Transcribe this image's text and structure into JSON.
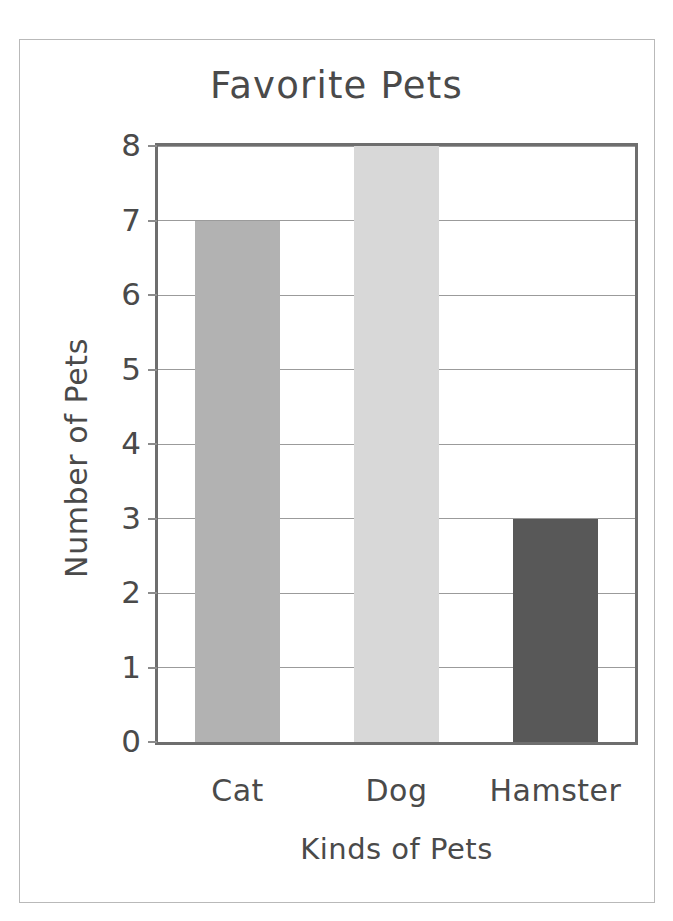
{
  "chart_data": {
    "type": "bar",
    "title": "Favorite Pets",
    "xlabel": "Kinds of Pets",
    "ylabel": "Number of Pets",
    "categories": [
      "Cat",
      "Dog",
      "Hamster"
    ],
    "values": [
      7,
      8,
      3
    ],
    "series": [
      {
        "name": "Number of Pets",
        "values": [
          7,
          8,
          3
        ]
      }
    ],
    "ylim": [
      0,
      8
    ],
    "ytick_labels": [
      "0",
      "1",
      "2",
      "3",
      "4",
      "5",
      "6",
      "7",
      "8"
    ],
    "ytick_values": [
      0,
      1,
      2,
      3,
      4,
      5,
      6,
      7,
      8
    ],
    "grid": true,
    "legend": false,
    "legend_position": "none",
    "bar_colors": [
      "#b2b2b2",
      "#d8d8d8",
      "#585858"
    ],
    "bars": [
      {
        "label": "Cat",
        "value": 7,
        "color": "#b2b2b2"
      },
      {
        "label": "Dog",
        "value": 8,
        "color": "#d8d8d8"
      },
      {
        "label": "Hamster",
        "value": 3,
        "color": "#585858"
      }
    ]
  },
  "style": {
    "text_color": "#4a4a4a",
    "axis_color": "#6e6e6e",
    "grid_color": "#9b9b9b",
    "frame_color": "#b9b9b9",
    "background": "#ffffff"
  }
}
